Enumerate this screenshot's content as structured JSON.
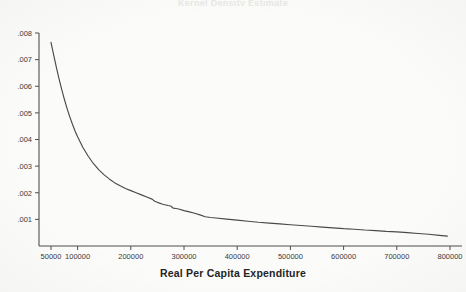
{
  "figure": {
    "title_remnant": "Kernel Density Estimate",
    "background_color": "#fbfbfa",
    "line_color": "#4a4a4a",
    "axis_color": "#4f4f4f",
    "text_color": "#242424"
  },
  "chart_data": {
    "type": "line",
    "title": "",
    "xlabel": "Real Per Capita Expenditure",
    "ylabel": "",
    "xlim": [
      40000,
      830000
    ],
    "ylim": [
      0,
      0.0083
    ],
    "grid": false,
    "legend": null,
    "x_ticks": [
      50000,
      100000,
      200000,
      300000,
      400000,
      500000,
      600000,
      700000,
      800000
    ],
    "x_tick_labels": [
      "50000",
      "100000",
      "200000",
      "300000",
      "400000",
      "500000",
      "600000",
      "700000",
      "800000"
    ],
    "y_ticks": [
      0.001,
      0.002,
      0.003,
      0.004,
      0.005,
      0.006,
      0.007,
      0.008
    ],
    "y_tick_labels": [
      ".001",
      ".002",
      ".003",
      ".004",
      ".005",
      ".006",
      ".007",
      ".008"
    ],
    "series": [
      {
        "name": "density",
        "x": [
          50000,
          55000,
          60000,
          65000,
          70000,
          75000,
          80000,
          85000,
          90000,
          95000,
          100000,
          110000,
          120000,
          130000,
          140000,
          150000,
          160000,
          170000,
          180000,
          190000,
          200000,
          210000,
          220000,
          230000,
          240000,
          245000,
          250000,
          260000,
          270000,
          275000,
          280000,
          285000,
          290000,
          300000,
          310000,
          320000,
          330000,
          340000,
          350000,
          360000,
          380000,
          400000,
          420000,
          440000,
          460000,
          480000,
          500000,
          520000,
          540000,
          560000,
          580000,
          600000,
          620000,
          640000,
          660000,
          680000,
          700000,
          720000,
          740000,
          760000,
          780000,
          795000
        ],
        "y": [
          0.00765,
          0.00718,
          0.00672,
          0.00629,
          0.00589,
          0.00552,
          0.00518,
          0.00487,
          0.00459,
          0.00433,
          0.0041,
          0.0037,
          0.00337,
          0.00309,
          0.00286,
          0.00267,
          0.00251,
          0.00237,
          0.00226,
          0.00216,
          0.00208,
          0.002,
          0.00192,
          0.00184,
          0.00176,
          0.00168,
          0.00164,
          0.00157,
          0.00152,
          0.0015,
          0.00142,
          0.00141,
          0.00139,
          0.00133,
          0.00128,
          0.00123,
          0.00117,
          0.0011,
          0.00107,
          0.00105,
          0.00101,
          0.00097,
          0.00093,
          0.00089,
          0.00086,
          0.00083,
          0.0008,
          0.00077,
          0.00074,
          0.00071,
          0.00068,
          0.00065,
          0.00063,
          0.0006,
          0.00058,
          0.00055,
          0.00053,
          0.0005,
          0.00047,
          0.00044,
          0.0004,
          0.00037
        ]
      }
    ]
  }
}
